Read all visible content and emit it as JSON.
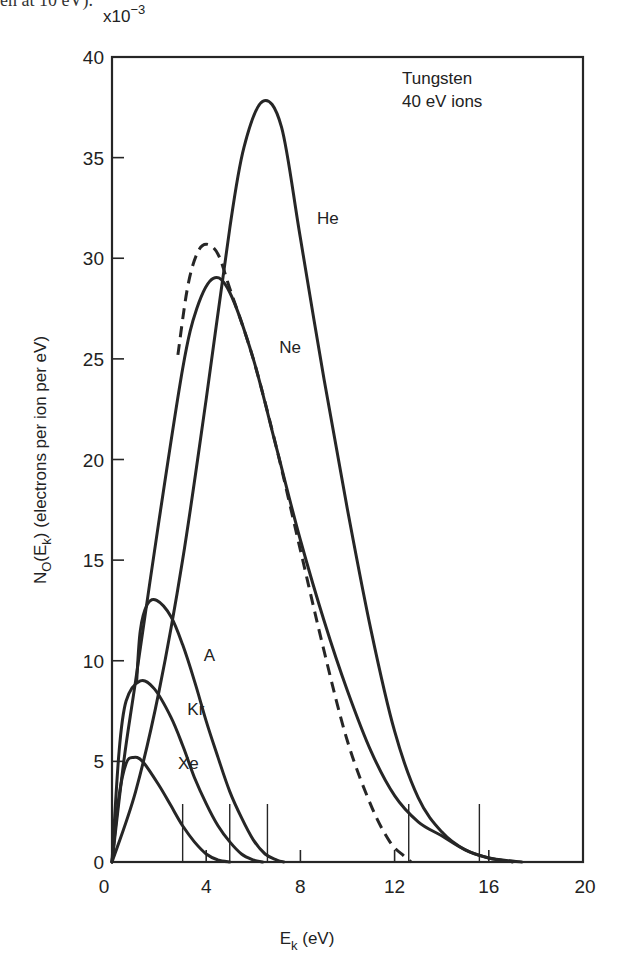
{
  "caption_fragment": "en at 10 eV).",
  "chart_data": {
    "type": "line",
    "title": "",
    "annotation": [
      "Tungsten",
      "40 eV ions"
    ],
    "xlabel": "E_k (eV)",
    "ylabel": "N_0(E_k)   (electrons per ion per eV)",
    "y_multiplier": "x10^-3",
    "xlim": [
      0,
      20
    ],
    "ylim": [
      0,
      40
    ],
    "x_ticks": [
      0,
      4,
      8,
      12,
      16,
      20
    ],
    "y_ticks": [
      0,
      5,
      10,
      15,
      20,
      25,
      30,
      35,
      40
    ],
    "grid": false,
    "legend": "inline labels",
    "series": [
      {
        "name": "He",
        "style": "solid",
        "x": [
          0,
          1,
          2,
          3,
          4,
          5,
          5.6,
          6.4,
          7.2,
          8,
          9,
          10,
          11,
          12,
          13,
          14,
          15,
          16,
          17,
          17.4
        ],
        "y": [
          0,
          3.5,
          8.5,
          15,
          23,
          31.5,
          35.5,
          37.8,
          36.5,
          31,
          24,
          17.5,
          11.5,
          6.5,
          3.2,
          1.5,
          0.6,
          0.2,
          0.05,
          0
        ]
      },
      {
        "name": "Ne",
        "style": "solid",
        "x": [
          0,
          0.5,
          1,
          2,
          3,
          3.6,
          4.3,
          5,
          6,
          7,
          8,
          9,
          10,
          11,
          12,
          13,
          14,
          15,
          16,
          17
        ],
        "y": [
          0,
          5,
          9,
          17,
          24.5,
          27.5,
          29,
          28.3,
          25,
          20.5,
          16,
          12,
          8.5,
          5.5,
          3.3,
          2,
          1.3,
          0.6,
          0.2,
          0
        ]
      },
      {
        "name": "Ne (dashed)",
        "style": "dashed",
        "x": [
          2.8,
          3.2,
          3.6,
          4.0,
          4.5,
          5,
          6,
          7,
          8,
          9,
          10,
          11,
          11.8,
          12.4,
          12.7
        ],
        "y": [
          25.2,
          28.5,
          30.2,
          30.7,
          30.2,
          28.5,
          25,
          20.5,
          15.5,
          10.5,
          6,
          2.8,
          1,
          0.3,
          0
        ]
      },
      {
        "name": "A",
        "style": "solid",
        "x": [
          1.05,
          1.2,
          1.5,
          1.9,
          2.5,
          3,
          3.5,
          4,
          4.5,
          5,
          5.5,
          6,
          6.5,
          7,
          7.3
        ],
        "y": [
          9,
          11.5,
          12.8,
          13,
          12.2,
          10.8,
          9,
          7,
          5.2,
          3.5,
          2.2,
          1.1,
          0.4,
          0.1,
          0
        ]
      },
      {
        "name": "Kr",
        "style": "solid",
        "x": [
          0,
          0.3,
          0.6,
          1.2,
          1.8,
          2.5,
          3,
          3.5,
          4,
          4.5,
          5,
          5.5,
          6,
          6.4
        ],
        "y": [
          0,
          5.5,
          8,
          9,
          8.6,
          7.2,
          5.8,
          4.2,
          2.9,
          1.8,
          1,
          0.4,
          0.1,
          0
        ]
      },
      {
        "name": "Xe",
        "style": "solid",
        "x": [
          0,
          0.3,
          0.6,
          0.9,
          1.3,
          2,
          2.5,
          3,
          3.5,
          4,
          4.5,
          5
        ],
        "y": [
          0,
          3.3,
          4.9,
          5.2,
          5,
          3.8,
          2.8,
          1.8,
          1,
          0.4,
          0.1,
          0
        ]
      }
    ],
    "vertical_markers": [
      3.0,
      5.0,
      6.6,
      12.6,
      15.6
    ],
    "series_labels": [
      {
        "text": "He",
        "x": 8.7,
        "y": 31.7
      },
      {
        "text": "Ne",
        "x": 7.1,
        "y": 25.3
      },
      {
        "text": "A",
        "x": 3.9,
        "y": 10.0
      },
      {
        "text": "Kr",
        "x": 3.2,
        "y": 7.3
      },
      {
        "text": "Xe",
        "x": 2.8,
        "y": 4.6
      }
    ]
  }
}
